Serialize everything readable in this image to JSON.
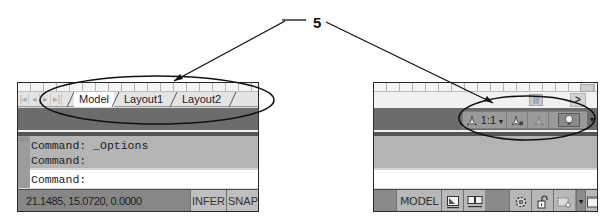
{
  "callout": {
    "number": "5"
  },
  "left_panel": {
    "nav_buttons": [
      {
        "icon": "first-icon",
        "glyph": "|◂"
      },
      {
        "icon": "prev-icon",
        "glyph": "◂"
      },
      {
        "icon": "next-icon",
        "glyph": "▸"
      },
      {
        "icon": "last-icon",
        "glyph": "▸|"
      }
    ],
    "tabs": [
      {
        "label": "Model",
        "active": true
      },
      {
        "label": "Layout1",
        "active": false
      },
      {
        "label": "Layout2",
        "active": false
      }
    ],
    "command_history": [
      "Command: _Options",
      "Command:"
    ],
    "command_prompt": "Command:",
    "status": {
      "coordinates": "21.1485, 15.0720, 0.0000",
      "buttons": [
        "INFER",
        "SNAP"
      ]
    }
  },
  "right_panel": {
    "scroll": {
      "thumb_glyph": "|||",
      "arrow_glyph": ">"
    },
    "annotation_toolbar": {
      "scale_label": "1:1",
      "scale_dropdown_glyph": "▾",
      "overflow_glyph": "▾",
      "items": [
        {
          "name": "annotation-scale",
          "icon": "annotation-scale-icon"
        },
        {
          "name": "annotation-visibility",
          "icon": "annotation-visibility-icon"
        },
        {
          "name": "auto-scale",
          "icon": "auto-scale-icon"
        },
        {
          "name": "isolate-objects",
          "icon": "lightbulb-icon"
        }
      ]
    },
    "status": {
      "model_label": "MODEL",
      "icons": [
        "layout-grid-icon",
        "quick-view-layouts-icon",
        "workspace-gear-icon",
        "lock-icon",
        "hardware-acceleration-icon",
        "dropdown-arrow-icon",
        "clean-screen-icon"
      ],
      "dropdown_glyph": "▾"
    }
  },
  "colors": {
    "panel_bg": "#d8d8d8",
    "dark_band": "#6c6c6c",
    "history_bg": "#b4b4b4",
    "statusbar_bg": "#878787",
    "button_bg": "#bfbfbf",
    "outline": "#1a1a1a"
  }
}
